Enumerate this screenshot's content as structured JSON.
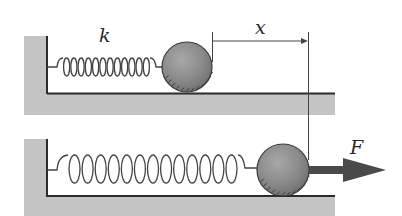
{
  "diagram": {
    "labels": {
      "spring_constant": "k",
      "displacement": "x",
      "force": "F"
    },
    "panels": [
      {
        "name": "equilibrium",
        "description": "Spring at rest length attached to wall, ball at rest"
      },
      {
        "name": "stretched",
        "description": "Spring stretched by displacement x under applied force F"
      }
    ],
    "colors": {
      "ground": "#c4c4c4",
      "line": "#2b2b2b",
      "ball": "#8c8c8c",
      "spring": "#444444",
      "arrow": "#4a4a4a"
    }
  }
}
